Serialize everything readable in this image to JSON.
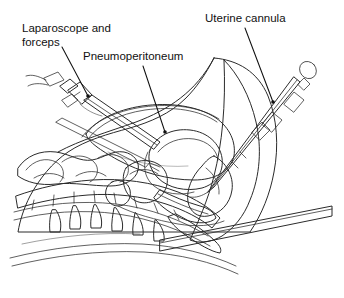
{
  "figure": {
    "width": 344,
    "height": 298,
    "background_color": "#ffffff",
    "ink_color": "#2b2b2b",
    "label_color": "#111111"
  },
  "labels": [
    {
      "id": "laparoscope-and-forceps",
      "line1": "Laparoscope and",
      "line2": "forceps",
      "x": 22,
      "y": 32,
      "leader": {
        "x1": 62,
        "y1": 47,
        "x2": 88,
        "y2": 96
      }
    },
    {
      "id": "pneumoperitoneum",
      "line1": "Pneumoperitoneum",
      "line2": "",
      "x": 83,
      "y": 60,
      "leader": {
        "x1": 143,
        "y1": 66,
        "x2": 165,
        "y2": 132
      }
    },
    {
      "id": "uterine-cannula",
      "line1": "Uterine cannula",
      "line2": "",
      "x": 205,
      "y": 22,
      "leader": {
        "x1": 245,
        "y1": 28,
        "x2": 273,
        "y2": 102
      }
    }
  ],
  "anatomy": {
    "shade_light": "#f2f2f2",
    "shade_mid": "#dcdcdc",
    "shade_dark": "#bdbdbd",
    "parts": [
      "abdominal-wall",
      "pneumoperitoneum-cavity",
      "uterus",
      "bladder",
      "rectum",
      "vagina",
      "small-bowel",
      "vertebral-column",
      "sacrum",
      "thigh",
      "operating-table"
    ]
  },
  "instruments": [
    {
      "id": "laparoscope-trocar",
      "name": "Laparoscope and forceps"
    },
    {
      "id": "uterine-cannula-shaft",
      "name": "Uterine cannula"
    }
  ]
}
